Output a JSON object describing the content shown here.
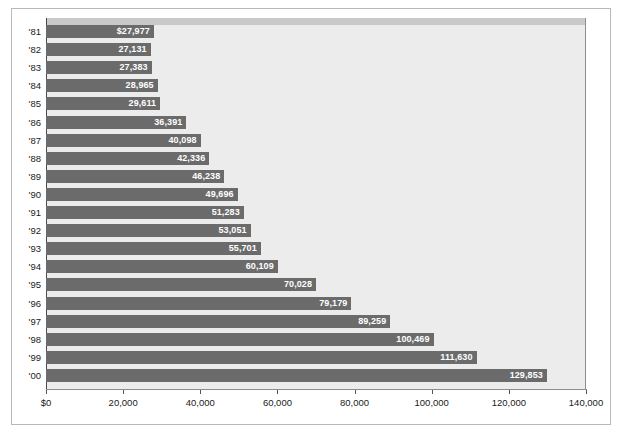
{
  "chart_data": {
    "type": "bar",
    "orientation": "horizontal",
    "title": "",
    "subtitle": "",
    "xlabel": "",
    "ylabel": "",
    "xlim": [
      0,
      140000
    ],
    "ylim": null,
    "grid": false,
    "legend": null,
    "legend_position": "none",
    "categories": [
      "'81",
      "'82",
      "'83",
      "'84",
      "'85",
      "'86",
      "'87",
      "'88",
      "'89",
      "'90",
      "'91",
      "'92",
      "'93",
      "'94",
      "'95",
      "'96",
      "'97",
      "'98",
      "'99",
      "'00"
    ],
    "values": [
      27977,
      27131,
      27383,
      28965,
      29611,
      36391,
      40098,
      42336,
      46238,
      49696,
      51283,
      53051,
      55701,
      60109,
      70028,
      79179,
      89259,
      100469,
      111630,
      129853
    ],
    "data_labels": [
      "$27,977",
      "27,131",
      "27,383",
      "28,965",
      "29,611",
      "36,391",
      "40,098",
      "42,336",
      "46,238",
      "49,696",
      "51,283",
      "53,051",
      "55,701",
      "60,109",
      "70,028",
      "79,179",
      "89,259",
      "100,469",
      "111,630",
      "129,853"
    ],
    "xticks": [
      0,
      20000,
      40000,
      60000,
      80000,
      100000,
      120000,
      140000
    ],
    "xtick_labels": [
      "$0",
      "20,000",
      "40,000",
      "60,000",
      "80,000",
      "100,000",
      "120,000",
      "140,000"
    ],
    "colors": {
      "bar": "#6b6b6b",
      "plot_background": "#ececec",
      "figure_background": "#ffffff",
      "data_label_text": "#ffffff",
      "axis_text": "#1a1a1a",
      "border": "#b8b8b8",
      "axis_line": "#4a4a4a",
      "top_band": "#c9c9c9"
    }
  }
}
